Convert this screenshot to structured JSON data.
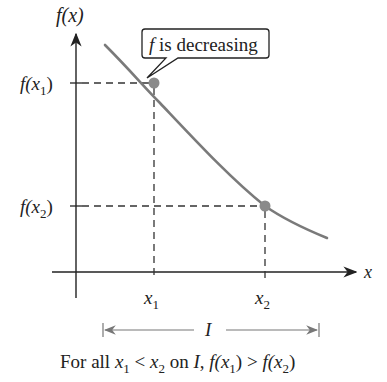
{
  "diagram": {
    "y_axis_label": "f(x)",
    "x_axis_label": "x",
    "callout": {
      "f": "f",
      "text": " is decreasing"
    },
    "y_ticks": [
      {
        "label_fn": "f(x",
        "sub": "1",
        "close": ")"
      },
      {
        "label_fn": "f(x",
        "sub": "2",
        "close": ")"
      }
    ],
    "x_ticks": [
      {
        "var": "x",
        "sub": "1"
      },
      {
        "var": "x",
        "sub": "2"
      }
    ],
    "interval_label": "I",
    "caption": {
      "prefix": "For all",
      "x1": "x",
      "s1": "1",
      "lt": " < ",
      "x2": "x",
      "s2": "2",
      "on": " on ",
      "I": "I",
      "comma": ", ",
      "f1": "f(x",
      "fs1": "1",
      "fc1": ")",
      "gt": " > ",
      "f2": "f(x",
      "fs2": "2",
      "fc2": ")"
    },
    "colors": {
      "curve": "#7a7a7a",
      "point": "#8a8a8a",
      "axis": "#222222",
      "dashed": "#333333",
      "interval": "#777777"
    }
  }
}
